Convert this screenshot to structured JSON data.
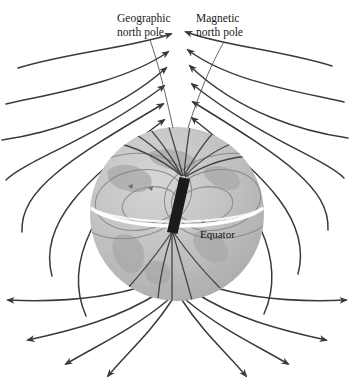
{
  "figure": {
    "background_color": "#ffffff"
  },
  "labels": {
    "geographic_pole": {
      "line1": "Geographic",
      "line2": "north pole"
    },
    "magnetic_pole": {
      "line1": "Magnetic",
      "line2": "north pole"
    },
    "equator": "Equator"
  },
  "colors": {
    "field_line": "#3a3a3a",
    "globe_fill": "#b9b9b9",
    "globe_light": "#cccccc",
    "continent": "#a9a9a9",
    "magnet_bar": "#1b1b1b",
    "equator_band": "#ffffff",
    "interior_line": "#8c8c8c",
    "text": "#1a1a1a"
  },
  "globe": {
    "center_x": 177,
    "center_y": 214,
    "radius": 87,
    "equator_label_x": 200,
    "equator_label_y": 236
  },
  "magnet": {
    "tilt_degrees": 11,
    "top_x": 184,
    "top_y": 178,
    "bottom_x": 172,
    "bottom_y": 233,
    "width": 11
  },
  "icons": {
    "arrowhead": "field-arrowhead"
  }
}
